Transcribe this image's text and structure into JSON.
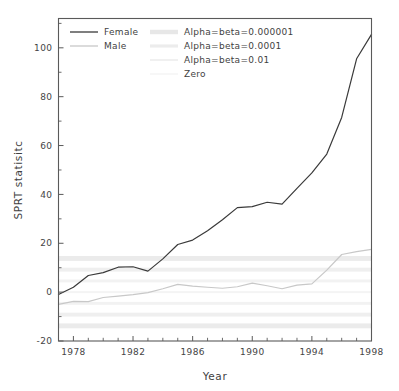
{
  "chart_data": {
    "type": "line",
    "title": "",
    "xlabel": "Year",
    "ylabel": "SPRT statisitc",
    "xlim": [
      1977.0,
      1998.0
    ],
    "ylim": [
      -20.0,
      112.0
    ],
    "xticks": [
      1978,
      1982,
      1986,
      1990,
      1994,
      1998
    ],
    "xtick_labels": [
      "1978",
      "1982",
      "1986",
      "1990",
      "1994",
      "1998"
    ],
    "xticks_minor": [
      1977,
      1979,
      1980,
      1981,
      1983,
      1984,
      1985,
      1987,
      1988,
      1989,
      1991,
      1992,
      1993,
      1995,
      1996,
      1997
    ],
    "yticks": [
      -20,
      0,
      20,
      40,
      60,
      80,
      100
    ],
    "ytick_labels": [
      "-20",
      "0",
      "20",
      "40",
      "60",
      "80",
      "100"
    ],
    "grid": false,
    "legend_position": "upper-left",
    "x": [
      1977,
      1978,
      1979,
      1980,
      1981,
      1982,
      1983,
      1984,
      1985,
      1986,
      1987,
      1988,
      1989,
      1990,
      1991,
      1992,
      1993,
      1994,
      1995,
      1996,
      1997,
      1998
    ],
    "series": [
      {
        "name": "Female",
        "color": "#3a3a3a",
        "linewidth": 1.2,
        "values": [
          -1.0,
          2.0,
          6.8,
          8.0,
          10.2,
          10.4,
          8.6,
          13.6,
          19.5,
          21.3,
          25.1,
          29.6,
          34.6,
          35.0,
          36.8,
          36.0,
          42.5,
          48.8,
          56.5,
          71.5,
          95.5,
          105.5
        ]
      },
      {
        "name": "Male",
        "color": "#c8c8c8",
        "linewidth": 1.2,
        "values": [
          -5.0,
          -3.8,
          -3.9,
          -2.2,
          -1.6,
          -1.0,
          -0.2,
          1.4,
          3.2,
          2.5,
          2.0,
          1.6,
          2.2,
          3.7,
          2.6,
          1.4,
          2.9,
          3.4,
          9.0,
          15.4,
          16.6,
          17.5
        ]
      }
    ],
    "reference_bands": [
      {
        "name": "Alpha=beta=0.000001",
        "color": "#ebebeb",
        "value": 13.8,
        "half_width": 1.0,
        "symmetric": true
      },
      {
        "name": "Alpha=beta=0.0001",
        "color": "#efefef",
        "value": 9.2,
        "half_width": 0.8,
        "symmetric": true
      },
      {
        "name": "Alpha=beta=0.01",
        "color": "#f2f2f2",
        "value": 4.6,
        "half_width": 0.6,
        "symmetric": true
      },
      {
        "name": "Zero",
        "color": "#f4f4f4",
        "value": 0.0,
        "half_width": 0.4,
        "symmetric": false
      }
    ]
  },
  "legend": {
    "entries": [
      {
        "label": "Female",
        "kind": "line",
        "color": "#3a3a3a",
        "width": 1.3
      },
      {
        "label": "Male",
        "kind": "line",
        "color": "#c8c8c8",
        "width": 1.3
      },
      {
        "label": "Alpha=beta=0.000001",
        "kind": "band",
        "color": "#e7e7e7",
        "width": 4.4
      },
      {
        "label": "Alpha=beta=0.0001",
        "kind": "band",
        "color": "#ececec",
        "width": 3.2
      },
      {
        "label": "Alpha=beta=0.01",
        "kind": "band",
        "color": "#f0f0f0",
        "width": 2.0
      },
      {
        "label": "Zero",
        "kind": "band",
        "color": "#f2f2f2",
        "width": 1.2
      }
    ]
  },
  "colors": {
    "background": "#ffffff",
    "frame": "#5a5a5a",
    "text": "#3f3f3f",
    "female": "#3a3a3a",
    "male": "#c8c8c8"
  }
}
